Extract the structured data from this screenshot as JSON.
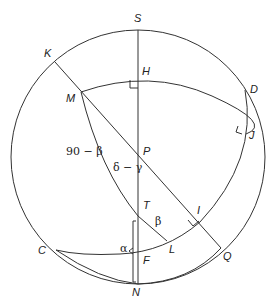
{
  "diagram": {
    "type": "celestial-sphere-geometry",
    "points": {
      "S": "S",
      "K": "K",
      "H": "H",
      "D": "D",
      "M": "M",
      "J": "J",
      "P": "P",
      "T": "T",
      "I": "I",
      "C": "C",
      "L": "L",
      "Q": "Q",
      "F": "F",
      "N": "N"
    },
    "angles": {
      "ninety_minus_beta": "90 − β",
      "delta_minus_gamma": "δ − γ",
      "beta": "β",
      "alpha": "α"
    },
    "colors": {
      "stroke": "#333333",
      "text": "#222222",
      "background": "#ffffff"
    }
  }
}
